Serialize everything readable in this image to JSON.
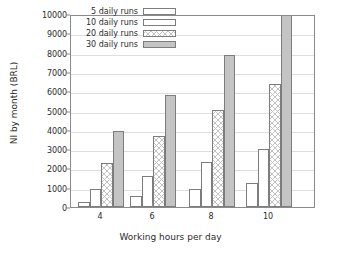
{
  "chart_data": {
    "type": "bar",
    "title": "",
    "xlabel": "Working hours per day",
    "ylabel": "NI by month (BRL)",
    "categories": [
      "4",
      "6",
      "8",
      "10"
    ],
    "xtick_labels": [
      "4",
      "6",
      "8",
      "10"
    ],
    "ytick_labels": [
      "0",
      "1000",
      "2000",
      "3000",
      "4000",
      "5000",
      "6000",
      "7000",
      "8000",
      "9000",
      "10000"
    ],
    "ytick_values": [
      0,
      1000,
      2000,
      3000,
      4000,
      5000,
      6000,
      7000,
      8000,
      9000,
      10000
    ],
    "ylim": [
      0,
      10000
    ],
    "grid": "horizontal",
    "legend_position": "top-left-inside",
    "series": [
      {
        "name": "5 daily runs",
        "fill": "empty",
        "values": [
          250,
          580,
          930,
          1230
        ]
      },
      {
        "name": "10 daily runs",
        "fill": "dotted",
        "values": [
          950,
          1630,
          2320,
          3000
        ]
      },
      {
        "name": "20 daily runs",
        "fill": "crosshatch",
        "values": [
          2280,
          3660,
          5050,
          6380
        ]
      },
      {
        "name": "30 daily runs",
        "fill": "solid-gray",
        "values": [
          3950,
          5800,
          7870,
          10400
        ],
        "notes": "last bar is clipped at the top of the axis"
      }
    ]
  },
  "colors": {
    "axis": "#8a8a8a",
    "grid": "#dedede",
    "text": "#2b2b2b",
    "bar_outline": "#7d7d7d",
    "bar_solid": "#c4c4c4",
    "background": "#ffffff"
  }
}
